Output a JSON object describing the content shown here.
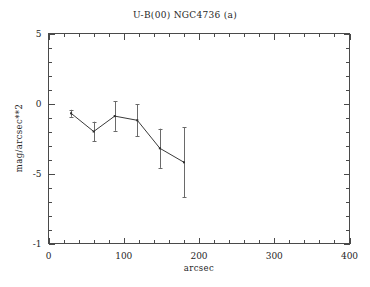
{
  "figure": {
    "title": "U-B(00) NGC4736 (a)",
    "background_color": "#ffffff",
    "ink_color": "#3a3a3a"
  },
  "chart_data": {
    "type": "line",
    "title": "U-B(00) NGC4736 (a)",
    "subtitle": "",
    "xlabel": "arcsec",
    "ylabel": "mag/arcsec**2",
    "xlim": [
      0,
      400
    ],
    "ylim": [
      -10,
      5
    ],
    "grid": false,
    "legend": false,
    "legend_position": "none",
    "xticks": [
      0,
      100,
      200,
      300,
      400
    ],
    "xtick_labels": [
      "0",
      "100",
      "200",
      "300",
      "400"
    ],
    "xminor_step": 20,
    "yticks": [
      5,
      0,
      -5,
      -10
    ],
    "ytick_labels": [
      "5",
      "0",
      "-5",
      "-1"
    ],
    "yminor_step": 1,
    "series": [
      {
        "name": "U-B(00) profile",
        "marker": "point",
        "line_style": "solid",
        "x": [
          30,
          60,
          88,
          118,
          148,
          180
        ],
        "y": [
          -0.7,
          -2.0,
          -0.9,
          -1.2,
          -3.2,
          -4.2
        ],
        "yerr": [
          0.25,
          0.7,
          1.05,
          1.15,
          1.4,
          2.5
        ]
      }
    ]
  }
}
